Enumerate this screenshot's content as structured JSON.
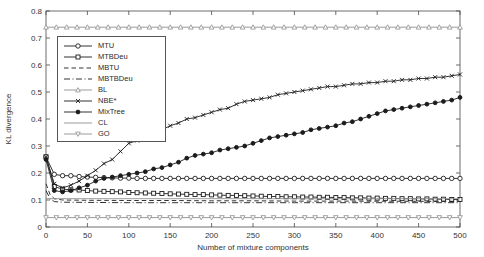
{
  "figure": {
    "background": "#ffffff",
    "text_color": "#333333",
    "axis_color": "#4a4a4a",
    "black_series_color": "#1c1c1c",
    "gray_series_color": "#8f8f8f"
  },
  "chart_data": {
    "type": "line",
    "title": "",
    "xlabel": "Number of mixture components",
    "ylabel": "KL divergence",
    "xlim": [
      0,
      500
    ],
    "ylim": [
      0,
      0.8
    ],
    "x_ticks": [
      0,
      50,
      100,
      150,
      200,
      250,
      300,
      350,
      400,
      450,
      500
    ],
    "y_ticks": [
      0,
      0.1,
      0.2,
      0.3,
      0.4,
      0.5,
      0.6,
      0.7,
      0.8
    ],
    "grid": false,
    "legend_position": "top-left",
    "series": [
      {
        "name": "MTU",
        "color": "#1c1c1c",
        "dash": "solid",
        "marker": "circle",
        "x": [
          0,
          10,
          20,
          30,
          40,
          50,
          60,
          70,
          80,
          90,
          100,
          110,
          120,
          130,
          140,
          150,
          160,
          170,
          180,
          190,
          200,
          210,
          220,
          230,
          240,
          250,
          260,
          270,
          280,
          290,
          300,
          310,
          320,
          330,
          340,
          350,
          360,
          370,
          380,
          390,
          400,
          410,
          420,
          430,
          440,
          450,
          460,
          470,
          480,
          490,
          500
        ],
        "y": [
          0.26,
          0.195,
          0.19,
          0.19,
          0.187,
          0.185,
          0.184,
          0.183,
          0.182,
          0.181,
          0.181,
          0.18,
          0.18,
          0.18,
          0.18,
          0.18,
          0.18,
          0.18,
          0.18,
          0.18,
          0.18,
          0.18,
          0.18,
          0.18,
          0.18,
          0.18,
          0.18,
          0.18,
          0.18,
          0.18,
          0.18,
          0.18,
          0.18,
          0.18,
          0.18,
          0.18,
          0.18,
          0.18,
          0.18,
          0.18,
          0.18,
          0.18,
          0.18,
          0.18,
          0.18,
          0.18,
          0.18,
          0.18,
          0.18,
          0.18,
          0.18
        ]
      },
      {
        "name": "MTBDeu",
        "color": "#1c1c1c",
        "dash": "solid",
        "marker": "square",
        "x": [
          0,
          10,
          20,
          30,
          40,
          50,
          60,
          70,
          80,
          90,
          100,
          110,
          120,
          130,
          140,
          150,
          160,
          170,
          180,
          190,
          200,
          210,
          220,
          230,
          240,
          250,
          260,
          270,
          280,
          290,
          300,
          310,
          320,
          330,
          340,
          350,
          360,
          370,
          380,
          390,
          400,
          410,
          420,
          430,
          440,
          450,
          460,
          470,
          480,
          490,
          500
        ],
        "y": [
          0.26,
          0.15,
          0.14,
          0.138,
          0.137,
          0.135,
          0.133,
          0.132,
          0.131,
          0.13,
          0.128,
          0.127,
          0.126,
          0.125,
          0.124,
          0.123,
          0.122,
          0.121,
          0.12,
          0.12,
          0.119,
          0.118,
          0.117,
          0.117,
          0.116,
          0.115,
          0.114,
          0.113,
          0.113,
          0.112,
          0.112,
          0.111,
          0.111,
          0.11,
          0.11,
          0.109,
          0.109,
          0.108,
          0.108,
          0.107,
          0.107,
          0.106,
          0.106,
          0.105,
          0.105,
          0.104,
          0.104,
          0.103,
          0.103,
          0.102,
          0.102
        ]
      },
      {
        "name": "MBTU",
        "color": "#1c1c1c",
        "dash": "dashed",
        "marker": "none",
        "x": [
          0,
          5,
          10,
          20,
          50,
          100,
          150,
          200,
          250,
          300,
          350,
          400,
          450,
          500
        ],
        "y": [
          0.16,
          0.12,
          0.105,
          0.1,
          0.099,
          0.098,
          0.098,
          0.097,
          0.097,
          0.096,
          0.096,
          0.0955,
          0.095,
          0.095
        ]
      },
      {
        "name": "MBTBDeu",
        "color": "#1c1c1c",
        "dash": "dashdot",
        "marker": "none",
        "x": [
          0,
          5,
          10,
          20,
          50,
          100,
          200,
          300,
          400,
          500
        ],
        "y": [
          0.135,
          0.105,
          0.094,
          0.092,
          0.091,
          0.09,
          0.09,
          0.09,
          0.09,
          0.09
        ]
      },
      {
        "name": "BL",
        "color": "#8f8f8f",
        "dash": "solid",
        "marker": "triangle-up",
        "x": [
          0,
          12.5,
          25,
          37.5,
          50,
          62.5,
          75,
          87.5,
          100,
          112.5,
          125,
          137.5,
          150,
          162.5,
          175,
          187.5,
          200,
          212.5,
          225,
          237.5,
          250,
          262.5,
          275,
          287.5,
          300,
          312.5,
          325,
          337.5,
          350,
          362.5,
          375,
          387.5,
          400,
          412.5,
          425,
          437.5,
          450,
          462.5,
          475,
          487.5,
          500
        ],
        "y": 0.74
      },
      {
        "name": "NBE*",
        "color": "#1c1c1c",
        "dash": "solid",
        "marker": "x",
        "x": [
          0,
          10,
          20,
          30,
          40,
          50,
          60,
          70,
          80,
          90,
          100,
          110,
          120,
          130,
          140,
          150,
          160,
          170,
          180,
          190,
          200,
          210,
          220,
          230,
          240,
          250,
          260,
          270,
          280,
          290,
          300,
          310,
          320,
          330,
          340,
          350,
          360,
          370,
          380,
          390,
          400,
          410,
          420,
          430,
          440,
          450,
          460,
          470,
          480,
          490,
          500
        ],
        "y": [
          0.26,
          0.16,
          0.145,
          0.155,
          0.17,
          0.19,
          0.21,
          0.235,
          0.25,
          0.28,
          0.31,
          0.32,
          0.33,
          0.345,
          0.36,
          0.375,
          0.385,
          0.4,
          0.405,
          0.415,
          0.425,
          0.435,
          0.44,
          0.455,
          0.465,
          0.47,
          0.475,
          0.48,
          0.49,
          0.495,
          0.5,
          0.505,
          0.51,
          0.515,
          0.52,
          0.52,
          0.525,
          0.53,
          0.53,
          0.535,
          0.535,
          0.54,
          0.54,
          0.545,
          0.545,
          0.55,
          0.55,
          0.555,
          0.555,
          0.56,
          0.565
        ]
      },
      {
        "name": "MixTree",
        "color": "#1c1c1c",
        "dash": "solid",
        "marker": "dot",
        "x": [
          0,
          10,
          20,
          30,
          40,
          50,
          60,
          70,
          80,
          90,
          100,
          110,
          120,
          130,
          140,
          150,
          160,
          170,
          180,
          190,
          200,
          210,
          220,
          230,
          240,
          250,
          260,
          270,
          280,
          290,
          300,
          310,
          320,
          330,
          340,
          350,
          360,
          370,
          380,
          390,
          400,
          410,
          420,
          430,
          440,
          450,
          460,
          470,
          480,
          490,
          500
        ],
        "y": [
          0.25,
          0.135,
          0.13,
          0.135,
          0.145,
          0.155,
          0.17,
          0.18,
          0.185,
          0.19,
          0.195,
          0.2,
          0.205,
          0.215,
          0.22,
          0.23,
          0.24,
          0.255,
          0.265,
          0.27,
          0.275,
          0.285,
          0.29,
          0.295,
          0.3,
          0.31,
          0.32,
          0.33,
          0.335,
          0.34,
          0.345,
          0.35,
          0.36,
          0.365,
          0.37,
          0.375,
          0.385,
          0.39,
          0.4,
          0.41,
          0.42,
          0.43,
          0.435,
          0.44,
          0.445,
          0.45,
          0.455,
          0.46,
          0.465,
          0.47,
          0.48
        ]
      },
      {
        "name": "CL",
        "color": "#8f8f8f",
        "dash": "solid",
        "marker": "none",
        "x": [
          0,
          500
        ],
        "y": [
          0.105,
          0.105
        ]
      },
      {
        "name": "GO",
        "color": "#8f8f8f",
        "dash": "solid",
        "marker": "triangle-down",
        "x": [
          0,
          12.5,
          25,
          37.5,
          50,
          62.5,
          75,
          87.5,
          100,
          112.5,
          125,
          137.5,
          150,
          162.5,
          175,
          187.5,
          200,
          212.5,
          225,
          237.5,
          250,
          262.5,
          275,
          287.5,
          300,
          312.5,
          325,
          337.5,
          350,
          362.5,
          375,
          387.5,
          400,
          412.5,
          425,
          437.5,
          450,
          462.5,
          475,
          487.5,
          500
        ],
        "y": 0.035
      }
    ]
  }
}
